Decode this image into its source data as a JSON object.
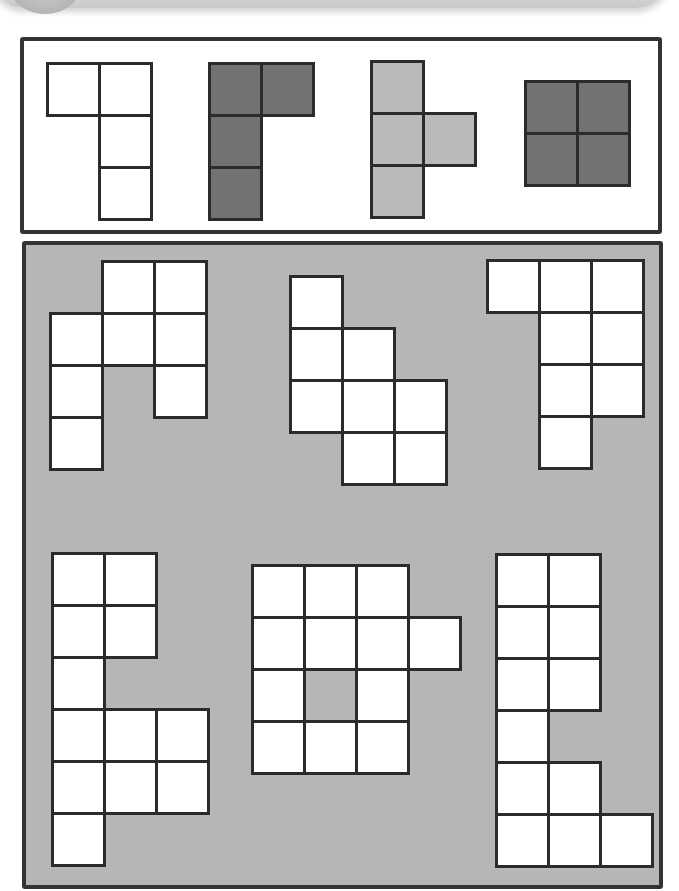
{
  "puzzle": {
    "cell_size": 52,
    "colors": {
      "outline": "#2b2b2b",
      "panel_border": "#333333",
      "bottom_panel_bg": "#b6b6b6",
      "white": "#ffffff",
      "dark_gray": "#727272",
      "light_gray": "#bababa"
    },
    "pieces_panel": {
      "pieces": [
        {
          "name": "white-l-tetromino",
          "color": "#ffffff",
          "cells": [
            [
              46,
              62
            ],
            [
              98,
              62
            ],
            [
              98,
              114
            ],
            [
              98,
              166
            ]
          ]
        },
        {
          "name": "dark-l-tetromino",
          "color": "#727272",
          "cells": [
            [
              208,
              62
            ],
            [
              260,
              62
            ],
            [
              208,
              114
            ],
            [
              208,
              166
            ]
          ]
        },
        {
          "name": "light-t-tetromino",
          "color": "#bababa",
          "cells": [
            [
              370,
              60
            ],
            [
              370,
              112
            ],
            [
              422,
              112
            ],
            [
              370,
              164
            ]
          ]
        },
        {
          "name": "dark-o-tetromino",
          "color": "#727272",
          "cells": [
            [
              524,
              80
            ],
            [
              576,
              80
            ],
            [
              524,
              132
            ],
            [
              576,
              132
            ]
          ]
        }
      ]
    },
    "shapes_panel": {
      "shapes": [
        {
          "name": "shape-1",
          "cells": [
            [
              101,
              260
            ],
            [
              153,
              260
            ],
            [
              49,
              312
            ],
            [
              101,
              312
            ],
            [
              153,
              312
            ],
            [
              49,
              364
            ],
            [
              153,
              364
            ],
            [
              49,
              416
            ]
          ]
        },
        {
          "name": "shape-2",
          "cells": [
            [
              289,
              275
            ],
            [
              289,
              327
            ],
            [
              341,
              327
            ],
            [
              289,
              379
            ],
            [
              341,
              379
            ],
            [
              393,
              379
            ],
            [
              341,
              431
            ],
            [
              393,
              431
            ]
          ]
        },
        {
          "name": "shape-3",
          "cells": [
            [
              486,
              259
            ],
            [
              538,
              259
            ],
            [
              590,
              259
            ],
            [
              538,
              311
            ],
            [
              590,
              311
            ],
            [
              538,
              363
            ],
            [
              590,
              363
            ],
            [
              538,
              415
            ]
          ]
        },
        {
          "name": "shape-4",
          "cells": [
            [
              51,
              552
            ],
            [
              103,
              552
            ],
            [
              51,
              604
            ],
            [
              103,
              604
            ],
            [
              51,
              656
            ],
            [
              51,
              708
            ],
            [
              103,
              708
            ],
            [
              155,
              708
            ],
            [
              51,
              760
            ],
            [
              103,
              760
            ],
            [
              155,
              760
            ],
            [
              51,
              812
            ]
          ]
        },
        {
          "name": "shape-5",
          "cells": [
            [
              251,
              564
            ],
            [
              303,
              564
            ],
            [
              355,
              564
            ],
            [
              251,
              616
            ],
            [
              303,
              616
            ],
            [
              355,
              616
            ],
            [
              407,
              616
            ],
            [
              251,
              668
            ],
            [
              355,
              668
            ],
            [
              251,
              720
            ],
            [
              303,
              720
            ],
            [
              355,
              720
            ]
          ]
        },
        {
          "name": "shape-6",
          "cells": [
            [
              495,
              553
            ],
            [
              547,
              553
            ],
            [
              495,
              605
            ],
            [
              547,
              605
            ],
            [
              495,
              657
            ],
            [
              547,
              657
            ],
            [
              495,
              709
            ],
            [
              495,
              761
            ],
            [
              547,
              761
            ],
            [
              495,
              813
            ],
            [
              547,
              813
            ],
            [
              599,
              813
            ]
          ]
        }
      ]
    }
  }
}
